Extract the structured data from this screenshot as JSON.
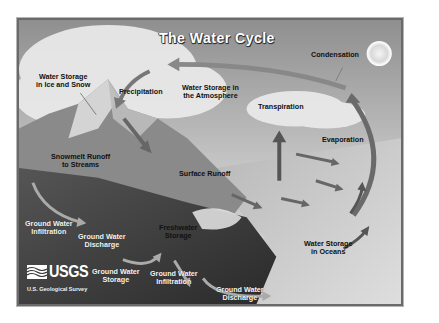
{
  "diagram": {
    "title": "The Water Cycle",
    "labels": {
      "condensation": "Condensation",
      "ice_snow_1": "Water Storage",
      "ice_snow_2": "in Ice and Snow",
      "precipitation": "Precipitation",
      "atmosphere_1": "Water Storage in",
      "atmosphere_2": "the Atmosphere",
      "transpiration": "Transpiration",
      "evaporation": "Evaporation",
      "snowmelt_1": "Snowmelt Runoff",
      "snowmelt_2": "to Streams",
      "surface_runoff": "Surface Runoff",
      "gw_infiltration_left_1": "Ground Water",
      "gw_infiltration_left_2": "Infiltration",
      "gw_discharge_left_1": "Ground Water",
      "gw_discharge_left_2": "Discharge",
      "freshwater_1": "Freshwater",
      "freshwater_2": "Storage",
      "oceans_1": "Water Storage",
      "oceans_2": "in Oceans",
      "gw_storage_1": "Ground Water",
      "gw_storage_2": "Storage",
      "gw_infiltration_mid_1": "Ground Water",
      "gw_infiltration_mid_2": "Infiltration",
      "gw_discharge_right_1": "Ground Water",
      "gw_discharge_right_2": "Discharge"
    },
    "logo": {
      "word": "USGS",
      "subtitle": "U.S. Geological Survey"
    },
    "colors": {
      "sky": "#bdbdbd",
      "cloud": "#ececec",
      "mountain": "#7a7a7a",
      "ground": "#3e3e3e",
      "ocean": "#c9c9c9",
      "arrow": "#8a8a8a",
      "frame": "#6a6a6a"
    }
  }
}
